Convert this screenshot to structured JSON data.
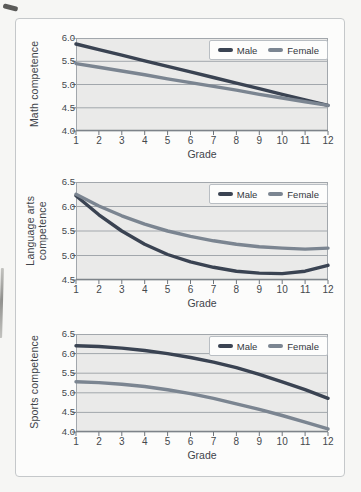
{
  "figure": {
    "caption": "",
    "style": {
      "male_color": "#3a4352",
      "female_color": "#7b8591",
      "plot_bg": "#eaeae9",
      "grid_color": "#a2a7ac",
      "axis_color": "#7d8389",
      "tick_color": "#70767c",
      "text_color": "#44484d",
      "frame_border": "#c5c8ca",
      "legend_border": "#b9bec3"
    }
  },
  "chart_data": [
    {
      "type": "line",
      "title": "",
      "ylabel": "Math competence",
      "ylabel_display": "Math competence",
      "xlabel": "Grade",
      "x": [
        1,
        2,
        3,
        4,
        5,
        6,
        7,
        8,
        9,
        10,
        11,
        12
      ],
      "xticks": [
        "1",
        "2",
        "3",
        "4",
        "5",
        "6",
        "7",
        "8",
        "9",
        "10",
        "11",
        "12"
      ],
      "ylim": [
        4.0,
        6.0
      ],
      "ytick_step": 0.5,
      "yticks": [
        "4.0",
        "4.5",
        "5.0",
        "5.5",
        "6.0"
      ],
      "grid": true,
      "legend_position": "top-right",
      "legend": [
        "Male",
        "Female"
      ],
      "series": [
        {
          "name": "Male",
          "color": "#3a4352",
          "values": [
            5.87,
            5.75,
            5.63,
            5.51,
            5.39,
            5.27,
            5.15,
            5.03,
            4.91,
            4.79,
            4.67,
            4.55
          ]
        },
        {
          "name": "Female",
          "color": "#7b8591",
          "values": [
            5.45,
            5.37,
            5.29,
            5.21,
            5.12,
            5.04,
            4.96,
            4.88,
            4.79,
            4.71,
            4.63,
            4.55
          ]
        }
      ]
    },
    {
      "type": "line",
      "title": "",
      "ylabel": "Language arts competence",
      "ylabel_display": "Language arts\ncompetence",
      "xlabel": "Grade",
      "x": [
        1,
        2,
        3,
        4,
        5,
        6,
        7,
        8,
        9,
        10,
        11,
        12
      ],
      "xticks": [
        "1",
        "2",
        "3",
        "4",
        "5",
        "6",
        "7",
        "8",
        "9",
        "10",
        "11",
        "12"
      ],
      "ylim": [
        4.5,
        6.5
      ],
      "ytick_step": 0.5,
      "yticks": [
        "4.5",
        "5.0",
        "5.5",
        "6.0",
        "6.5"
      ],
      "grid": true,
      "legend_position": "top-right",
      "legend": [
        "Male",
        "Female"
      ],
      "series": [
        {
          "name": "Male",
          "color": "#3a4352",
          "values": [
            6.22,
            5.83,
            5.5,
            5.23,
            5.02,
            4.87,
            4.76,
            4.68,
            4.64,
            4.63,
            4.68,
            4.8
          ]
        },
        {
          "name": "Female",
          "color": "#7b8591",
          "values": [
            6.25,
            6.01,
            5.81,
            5.64,
            5.5,
            5.39,
            5.3,
            5.23,
            5.18,
            5.15,
            5.13,
            5.15
          ]
        }
      ]
    },
    {
      "type": "line",
      "title": "",
      "ylabel": "Sports competence",
      "ylabel_display": "Sports competence",
      "xlabel": "Grade",
      "x": [
        1,
        2,
        3,
        4,
        5,
        6,
        7,
        8,
        9,
        10,
        11,
        12
      ],
      "xticks": [
        "1",
        "2",
        "3",
        "4",
        "5",
        "6",
        "7",
        "8",
        "9",
        "10",
        "11",
        "12"
      ],
      "ylim": [
        4.0,
        6.5
      ],
      "ytick_step": 0.5,
      "yticks": [
        "4.0",
        "4.5",
        "5.0",
        "5.5",
        "6.0",
        "6.5"
      ],
      "grid": true,
      "legend_position": "top-right",
      "legend": [
        "Male",
        "Female"
      ],
      "series": [
        {
          "name": "Male",
          "color": "#3a4352",
          "values": [
            6.2,
            6.18,
            6.14,
            6.08,
            6.0,
            5.9,
            5.78,
            5.64,
            5.47,
            5.28,
            5.08,
            4.86
          ]
        },
        {
          "name": "Female",
          "color": "#7b8591",
          "values": [
            5.28,
            5.26,
            5.22,
            5.16,
            5.08,
            4.98,
            4.86,
            4.72,
            4.58,
            4.42,
            4.25,
            4.08
          ]
        }
      ]
    }
  ]
}
